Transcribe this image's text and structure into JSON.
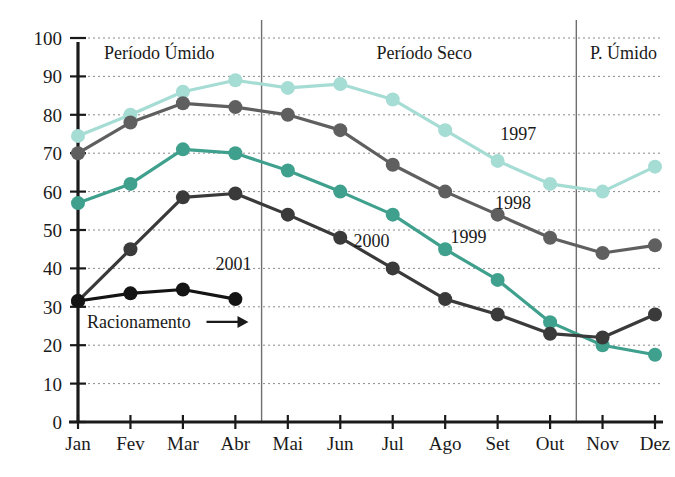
{
  "chart_data": {
    "type": "line",
    "title": "",
    "subtitle": "",
    "xlabel": "",
    "ylabel": "",
    "categories": [
      "Jan",
      "Fev",
      "Mar",
      "Abr",
      "Mai",
      "Jun",
      "Jul",
      "Ago",
      "Set",
      "Out",
      "Nov",
      "Dez"
    ],
    "xlim": [
      0,
      11
    ],
    "ylim": [
      0,
      100
    ],
    "yticks": [
      0,
      10,
      20,
      30,
      40,
      50,
      60,
      70,
      80,
      90,
      100
    ],
    "ytick_labels": [
      "0",
      "10",
      "20",
      "30",
      "40",
      "50",
      "60",
      "70",
      "80",
      "90",
      "100"
    ],
    "grid": true,
    "grid_axis": "y",
    "legend_position": "inline-annotations",
    "series": [
      {
        "name": "1997",
        "color": "#a5dcd4",
        "label": "1997",
        "label_x": 8.05,
        "label_y": 73.5,
        "values": [
          74.5,
          80,
          86,
          89,
          87,
          88,
          84,
          76,
          68,
          62,
          60,
          66.5
        ]
      },
      {
        "name": "1998",
        "color": "#5f5f5f",
        "label": "1998",
        "label_x": 7.95,
        "label_y": 55.5,
        "values": [
          70,
          78,
          83,
          82,
          80,
          76,
          67,
          60,
          54,
          48,
          44,
          46
        ]
      },
      {
        "name": "1999",
        "color": "#3fa08d",
        "label": "1999",
        "label_x": 7.1,
        "label_y": 46.5,
        "values": [
          57,
          62,
          71,
          70,
          65.5,
          60,
          54,
          45,
          37,
          26,
          20,
          17.5
        ]
      },
      {
        "name": "2000",
        "color": "#3a3a3a",
        "label": "2000",
        "label_x": 5.25,
        "label_y": 45.5,
        "values": [
          31.5,
          45,
          58.5,
          59.5,
          54,
          48,
          40,
          32,
          28,
          23,
          22,
          28
        ]
      },
      {
        "name": "2001",
        "color": "#141414",
        "label": "2001",
        "label_x": 2.62,
        "label_y": 39.5,
        "values": [
          31.5,
          33.5,
          34.5,
          32,
          null,
          null,
          null,
          null,
          null,
          null,
          null,
          null
        ]
      }
    ],
    "period_regions": [
      {
        "label": "Período Úmido",
        "center_x": 1.55,
        "label_y": 94.5
      },
      {
        "label": "Período Seco",
        "center_x": 6.6,
        "label_y": 94.5
      },
      {
        "label": "P. Úmido",
        "center_x": 10.4,
        "label_y": 94.5
      }
    ],
    "dividers": [
      {
        "x": 3.5
      },
      {
        "x": 9.5
      }
    ],
    "annotations": [
      {
        "text": "Racionamento",
        "x": 0.17,
        "y": 24.5,
        "arrow": true,
        "arrow_from_x": 2.45,
        "arrow_to_x": 3.25,
        "arrow_y": 24.5
      }
    ]
  }
}
